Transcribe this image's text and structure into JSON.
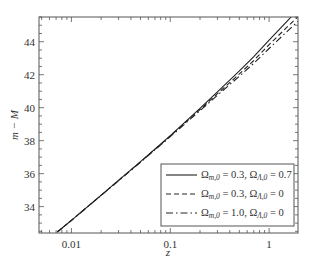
{
  "chart_data": {
    "type": "line",
    "title": "",
    "xlabel": "z",
    "ylabel": "m − M",
    "xscale": "log",
    "xlim": [
      0.0047,
      1.96
    ],
    "ylim": [
      32.4,
      45.5
    ],
    "x_ticks": [
      {
        "value": 0.01,
        "label": "0.01"
      },
      {
        "value": 0.1,
        "label": "0.1"
      },
      {
        "value": 1,
        "label": "1"
      }
    ],
    "y_ticks": [
      {
        "value": 34,
        "label": "34"
      },
      {
        "value": 36,
        "label": "36"
      },
      {
        "value": 38,
        "label": "38"
      },
      {
        "value": 40,
        "label": "40"
      },
      {
        "value": 42,
        "label": "42"
      },
      {
        "value": 44,
        "label": "44"
      }
    ],
    "grid": false,
    "legend_position": "lower right",
    "series": [
      {
        "name": "Ωm,0 = 0.3, ΩΛ,0 = 0.7",
        "style": "solid",
        "x": [
          0.0072,
          0.01,
          0.02,
          0.05,
          0.1,
          0.2,
          0.3,
          0.5,
          0.7,
          1.0,
          1.5,
          1.96
        ],
        "values": [
          32.46,
          33.17,
          34.7,
          36.73,
          38.31,
          39.96,
          40.96,
          42.24,
          43.1,
          44.1,
          45.21,
          45.95
        ]
      },
      {
        "name": "Ωm,0 = 0.3, ΩΛ,0 = 0",
        "style": "dashed",
        "x": [
          0.0072,
          0.01,
          0.02,
          0.05,
          0.1,
          0.2,
          0.3,
          0.5,
          0.7,
          1.0,
          1.5,
          1.96
        ],
        "values": [
          32.46,
          33.17,
          34.69,
          36.71,
          38.28,
          39.89,
          40.85,
          42.05,
          42.86,
          43.82,
          44.85,
          45.52
        ]
      },
      {
        "name": "Ωm,0 = 1.0, ΩΛ,0 = 0",
        "style": "dashdot",
        "x": [
          0.0072,
          0.01,
          0.02,
          0.05,
          0.1,
          0.2,
          0.3,
          0.5,
          0.7,
          1.0,
          1.5,
          1.96
        ],
        "values": [
          32.46,
          33.16,
          34.68,
          36.69,
          38.24,
          39.82,
          40.75,
          41.91,
          42.69,
          43.59,
          44.59,
          45.24
        ]
      }
    ]
  },
  "legend": {
    "items": [
      {
        "prefix": "Ω",
        "sub1": "m,0",
        "mid": " = 0.3, Ω",
        "sub2": "Λ,0",
        "suffix": " = 0.7",
        "style": "solid"
      },
      {
        "prefix": "Ω",
        "sub1": "m,0",
        "mid": " = 0.3, Ω",
        "sub2": "Λ,0",
        "suffix": " = 0",
        "style": "dashed"
      },
      {
        "prefix": "Ω",
        "sub1": "m,0",
        "mid": " = 1.0, Ω",
        "sub2": "Λ,0",
        "suffix": " = 0",
        "style": "dashdot"
      }
    ]
  },
  "axes": {
    "x_title": "z",
    "y_title": "m − M"
  }
}
